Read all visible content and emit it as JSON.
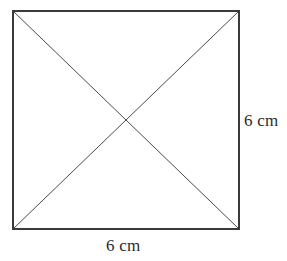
{
  "figure": {
    "type": "geometry-diagram",
    "shape_name": "square-with-diagonals",
    "background_color": "#ffffff",
    "border_color": "#3a3a3a",
    "diagonal_color": "#4a4a4a",
    "label_color": "#2b2b2b",
    "border_width_px": 2,
    "diagonal_width_px": 1,
    "square": {
      "left": 13,
      "top": 11,
      "right": 239,
      "bottom": 229,
      "width": 226,
      "height": 218
    },
    "center_point": {
      "x": 126,
      "y": 120
    },
    "corners": {
      "top_left": "13,11",
      "top_right": "239,11",
      "bottom_right": "239,229",
      "bottom_left": "13,229"
    },
    "diagonals": [
      {
        "name": "diagonal-top-left-to-bottom-right",
        "from": "13,11",
        "to": "239,229"
      },
      {
        "name": "diagonal-top-right-to-bottom-left",
        "from": "239,11",
        "to": "13,229"
      }
    ],
    "labels": {
      "right_side": "6 cm",
      "bottom_side": "6 cm"
    },
    "measurements": {
      "side_length_value": 6,
      "unit": "cm"
    }
  }
}
